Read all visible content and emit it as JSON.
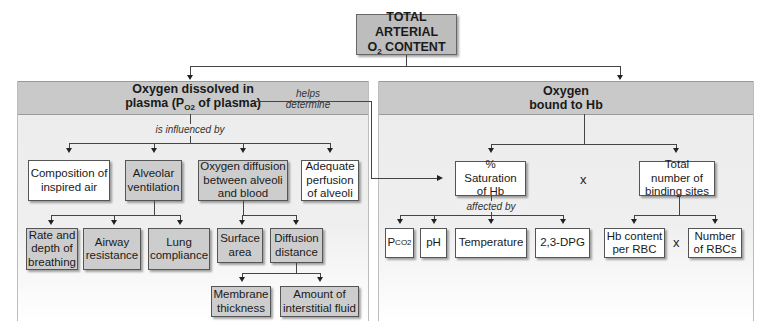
{
  "title": {
    "line1": "TOTAL ARTERIAL",
    "line2_main": "O",
    "line2_sub": "2",
    "line2_rest": " CONTENT"
  },
  "left_panel": {
    "heading_line1": "Oxygen dissolved in",
    "heading_line2_pre": "plasma (P",
    "heading_line2_sub": "O2",
    "heading_line2_post": " of plasma)",
    "connector_label": "is influenced by",
    "factors": [
      {
        "label": "Composition of inspired air",
        "style": "white"
      },
      {
        "label": "Alveolar ventilation",
        "style": "gray"
      },
      {
        "label": "Oxygen diffusion between alveoli and blood",
        "style": "gray"
      },
      {
        "label": "Adequate perfusion of alveoli",
        "style": "white"
      }
    ],
    "ventilation_factors": [
      "Rate and depth of breathing",
      "Airway resistance",
      "Lung compliance"
    ],
    "diffusion_factors": [
      "Surface area",
      "Diffusion distance"
    ],
    "distance_factors": [
      "Membrane thickness",
      "Amount of interstitial fluid"
    ]
  },
  "link_label": {
    "line1": "helps",
    "line2": "determine"
  },
  "right_panel": {
    "heading_line1": "Oxygen",
    "heading_line2": "bound to Hb",
    "saturation": "% Saturation of Hb",
    "multiply": "x",
    "binding_sites": "Total number of binding sites",
    "affected_label": "affected by",
    "saturation_factors": [
      {
        "label_main": "P",
        "label_sub": "CO2"
      },
      {
        "label_main": "pH"
      },
      {
        "label_main": "Temperature"
      },
      {
        "label_main": "2,3-DPG"
      }
    ],
    "binding_factors": [
      "Hb content per RBC",
      "Number of RBCs"
    ]
  },
  "colors": {
    "gray_box": "#cdcdcd",
    "header_band": "#c9c9c9",
    "panel_bg": "#ececec",
    "line": "#444444"
  }
}
